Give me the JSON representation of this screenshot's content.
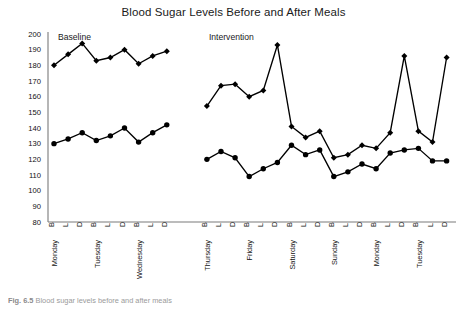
{
  "chart_data": {
    "type": "line",
    "title": "Blood Sugar Levels Before and After Meals",
    "xlabel": "",
    "ylabel": "",
    "ylim": [
      80,
      200
    ],
    "ytick_step": 10,
    "yticks": [
      200,
      190,
      180,
      170,
      160,
      150,
      140,
      130,
      120,
      110,
      100,
      90,
      80
    ],
    "grid": false,
    "legend": "none",
    "phases": [
      {
        "name": "Baseline",
        "start_index": 0,
        "end_index": 8
      },
      {
        "name": "Intervention",
        "start_index": 9,
        "end_index": 26
      }
    ],
    "day_groups": [
      {
        "day": "Monday",
        "meals": [
          "B",
          "L",
          "D"
        ]
      },
      {
        "day": "Tuesday",
        "meals": [
          "B",
          "L",
          "D"
        ]
      },
      {
        "day": "Wednesday",
        "meals": [
          "B",
          "L",
          "D"
        ]
      },
      {
        "day": "Thursday",
        "meals": [
          "B",
          "L",
          "D"
        ]
      },
      {
        "day": "Friday",
        "meals": [
          "B",
          "L",
          "D"
        ]
      },
      {
        "day": "Saturday",
        "meals": [
          "B",
          "L",
          "D"
        ]
      },
      {
        "day": "Sunday",
        "meals": [
          "B",
          "L",
          "D"
        ]
      },
      {
        "day": "Monday",
        "meals": [
          "B",
          "L",
          "D"
        ]
      },
      {
        "day": "Tuesday",
        "meals": [
          "B",
          "L",
          "D"
        ]
      }
    ],
    "categories": [
      "Monday B",
      "L",
      "D",
      "Tuesday B",
      "L",
      "D",
      "Wednesday B",
      "L",
      "D",
      "Thursday B",
      "L",
      "D",
      "Friday B",
      "L",
      "D",
      "Saturday B",
      "L",
      "D",
      "Sunday B",
      "L",
      "D",
      "Monday B",
      "L",
      "D",
      "Tuesday B",
      "L",
      "D"
    ],
    "series": [
      {
        "name": "After meal",
        "marker": "diamond",
        "values": [
          180,
          187,
          194,
          183,
          185,
          190,
          181,
          186,
          189,
          154,
          167,
          168,
          160,
          164,
          193,
          141,
          134,
          138,
          121,
          123,
          129,
          127,
          137,
          186,
          138,
          131,
          185
        ]
      },
      {
        "name": "Before meal",
        "marker": "circle",
        "values": [
          130,
          133,
          137,
          132,
          135,
          140,
          131,
          137,
          142,
          120,
          125,
          121,
          109,
          114,
          118,
          129,
          123,
          126,
          109,
          112,
          117,
          114,
          124,
          126,
          127,
          119,
          119
        ]
      }
    ]
  },
  "caption": {
    "prefix": "Fig. 6.5",
    "text": "Blood sugar levels before and after meals"
  }
}
